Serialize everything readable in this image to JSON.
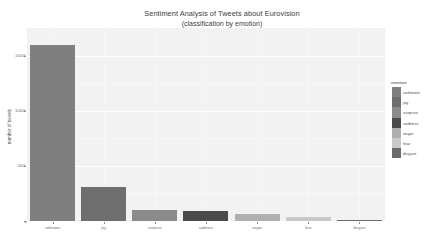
{
  "chart_data": {
    "type": "bar",
    "title": "Sentiment Analysis of Tweets about Eurovision",
    "subtitle": "(classification by emotion)",
    "xlabel": "",
    "ylabel": "number of tweets",
    "categories": [
      "unknown",
      "joy",
      "surprise",
      "sadness",
      "anger",
      "fear",
      "disgust"
    ],
    "values": [
      16000,
      3100,
      1000,
      900,
      600,
      330,
      90
    ],
    "series": [
      {
        "name": "emotion",
        "values": [
          16000,
          3100,
          1000,
          900,
          600,
          330,
          90
        ]
      }
    ],
    "ylim": [
      0,
      17500
    ],
    "yticks": [
      0,
      5000,
      10000,
      15000
    ],
    "ytick_labels": [
      "0",
      "5000",
      "10000",
      "15000"
    ],
    "grid": true,
    "legend_position": "right",
    "legend_title": "emotion",
    "legend_entries": [
      {
        "label": "unknown",
        "color": "#7f7f7f"
      },
      {
        "label": "joy",
        "color": "#6e6e6e"
      },
      {
        "label": "surprise",
        "color": "#8a8a8a"
      },
      {
        "label": "sadness",
        "color": "#4a4a4a"
      },
      {
        "label": "anger",
        "color": "#b0b0b0"
      },
      {
        "label": "fear",
        "color": "#c9c9c9"
      },
      {
        "label": "disgust",
        "color": "#6b6b6b"
      }
    ],
    "bar_colors": [
      "#7f7f7f",
      "#6e6e6e",
      "#8a8a8a",
      "#4a4a4a",
      "#b0b0b0",
      "#c9c9c9",
      "#6b6b6b"
    ],
    "panel_background": "#f2f2f2",
    "figure_background": "#ffffff"
  }
}
